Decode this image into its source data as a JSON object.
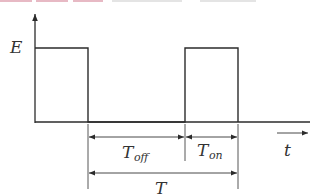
{
  "diagram": {
    "type": "pulse-waveform",
    "y_axis_label": "E",
    "x_axis_label": "t",
    "dimensions": {
      "off_label_main": "T",
      "off_label_sub": "off",
      "on_label_main": "T",
      "on_label_sub": "on",
      "period_label": "T"
    },
    "colors": {
      "line": "#2b2b2b",
      "thin_line": "#444444",
      "top_strip": "#e7b9c4",
      "top_strip_gray": "#dcdcdc"
    }
  }
}
